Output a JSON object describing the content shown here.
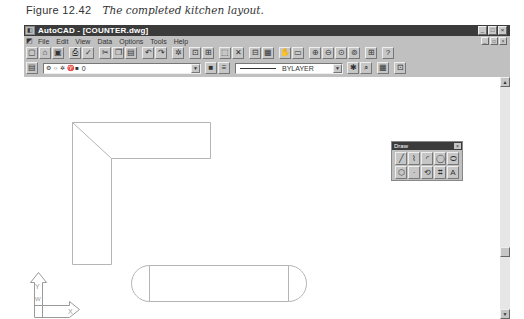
{
  "caption": {
    "figure": "Figure 12.42",
    "title": "The completed kitchen layout."
  },
  "window": {
    "title": "AutoCAD - [COUNTER.dwg]",
    "controls": [
      "_",
      "□",
      "×"
    ]
  },
  "menubar": {
    "items": [
      {
        "label": "File"
      },
      {
        "label": "Edit"
      },
      {
        "label": "View"
      },
      {
        "label": "Data"
      },
      {
        "label": "Options"
      },
      {
        "label": "Tools"
      },
      {
        "label": "Help"
      }
    ]
  },
  "toolbar_standard": {
    "buttons": [
      {
        "name": "new-icon",
        "glyph": "▢"
      },
      {
        "name": "open-icon",
        "glyph": "⌂"
      },
      {
        "name": "save-icon",
        "glyph": "▣"
      },
      {
        "name": "print-icon",
        "glyph": "⎙"
      },
      {
        "name": "spelling-icon",
        "glyph": "✓"
      },
      {
        "name": "cut-icon",
        "glyph": "✂"
      },
      {
        "name": "copy-icon",
        "glyph": "❐"
      },
      {
        "name": "paste-icon",
        "glyph": "▤"
      },
      {
        "name": "undo-icon",
        "glyph": "↶"
      },
      {
        "name": "redo-icon",
        "glyph": "↷"
      },
      {
        "name": "object-snap-icon",
        "glyph": "✲"
      },
      {
        "name": "point-filter-icon",
        "glyph": "⊡"
      },
      {
        "name": "ucs-icon",
        "glyph": "⊞"
      },
      {
        "name": "window-select-icon",
        "glyph": "⬚"
      },
      {
        "name": "redraw-icon",
        "glyph": "✕"
      },
      {
        "name": "aerial-view-icon",
        "glyph": "⊟"
      },
      {
        "name": "named-views-icon",
        "glyph": "▦"
      },
      {
        "name": "pan-icon",
        "glyph": "✋"
      },
      {
        "name": "zoom-window-icon",
        "glyph": "▭"
      },
      {
        "name": "zoom-in-icon",
        "glyph": "⊕"
      },
      {
        "name": "zoom-out-icon",
        "glyph": "⊖"
      },
      {
        "name": "zoom-all-icon",
        "glyph": "⊙"
      },
      {
        "name": "zoom-previous-icon",
        "glyph": "⊚"
      },
      {
        "name": "tiled-viewports-icon",
        "glyph": "⊞"
      },
      {
        "name": "help-icon",
        "glyph": "?"
      }
    ]
  },
  "toolbar_properties": {
    "layer_button_glyph": "▤",
    "layer_combo_value": "0",
    "layer_icons": "⚙ ☼ ✲ ♈ ■",
    "color_button_glyph": "■",
    "linetype_button_glyph": "≡",
    "linetype_combo_value": "BYLAYER",
    "right_buttons": [
      {
        "name": "properties-icon",
        "glyph": "✱"
      },
      {
        "name": "match-properties-icon",
        "glyph": "⌕"
      },
      {
        "name": "list-icon",
        "glyph": "▦"
      },
      {
        "name": "inquiry-icon",
        "glyph": "⊡"
      }
    ]
  },
  "draw_toolbar": {
    "title": "Draw",
    "close": "×",
    "buttons": [
      {
        "name": "line-icon",
        "glyph": "╱"
      },
      {
        "name": "polyline-icon",
        "glyph": "⌇"
      },
      {
        "name": "arc-icon",
        "glyph": "◜"
      },
      {
        "name": "circle-icon",
        "glyph": "◯"
      },
      {
        "name": "ellipse-icon",
        "glyph": "⬭"
      },
      {
        "name": "polygon-icon",
        "glyph": "⬡"
      },
      {
        "name": "point-icon",
        "glyph": "·"
      },
      {
        "name": "block-icon",
        "glyph": "⟲"
      },
      {
        "name": "hatch-icon",
        "glyph": "⌗"
      },
      {
        "name": "text-icon",
        "glyph": "A"
      }
    ]
  },
  "ucs_icon": {
    "y_label": "Y",
    "w_label": "W",
    "x_label": "X"
  },
  "scrollbar": {
    "up": "▲",
    "down": "▼"
  }
}
